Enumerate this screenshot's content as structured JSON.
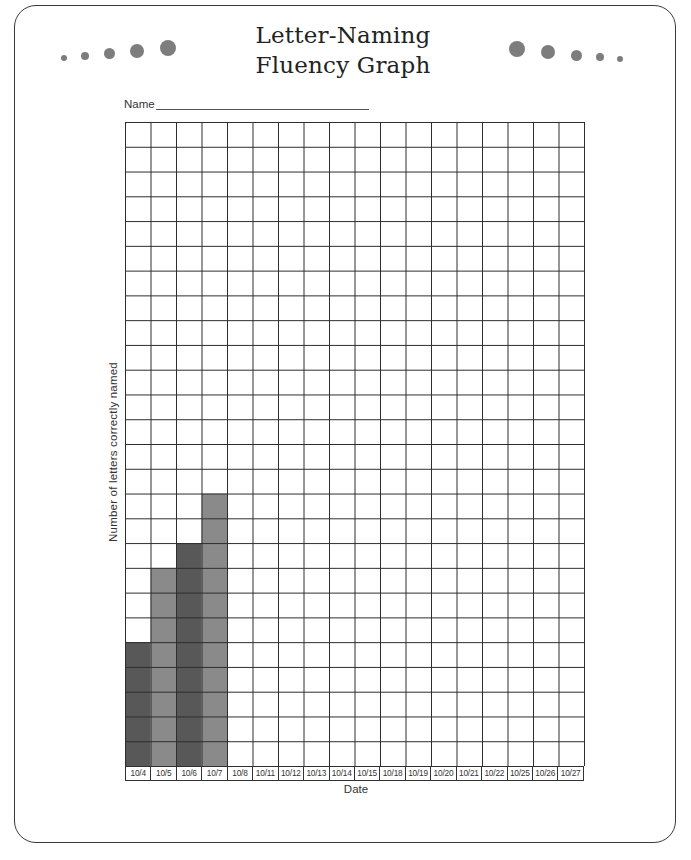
{
  "page": {
    "title_line1": "Letter-Naming",
    "title_line2": "Fluency Graph",
    "name_label": "Name"
  },
  "decorations": {
    "left_dots": [
      {
        "cx": 64,
        "cy": 58,
        "r": 3
      },
      {
        "cx": 85,
        "cy": 56,
        "r": 4
      },
      {
        "cx": 109,
        "cy": 53,
        "r": 5.5
      },
      {
        "cx": 137,
        "cy": 51,
        "r": 7
      },
      {
        "cx": 168,
        "cy": 48,
        "r": 8
      }
    ],
    "right_dots": [
      {
        "cx": 517,
        "cy": 49,
        "r": 8
      },
      {
        "cx": 548,
        "cy": 52,
        "r": 7
      },
      {
        "cx": 576,
        "cy": 55,
        "r": 5.5
      },
      {
        "cx": 600,
        "cy": 57,
        "r": 4
      },
      {
        "cx": 620,
        "cy": 59,
        "r": 3
      },
      {
        "color": "#7d7d7d"
      }
    ]
  },
  "colors": {
    "bar_dark": "#585858",
    "bar_light": "#8a8a8a",
    "grid_line": "#2e2e2e",
    "dot": "#7d7d7d"
  },
  "chart_data": {
    "type": "bar",
    "title": "Letter-Naming Fluency Graph",
    "xlabel": "Date",
    "ylabel": "Number of letters correctly named",
    "categories": [
      "10/4",
      "10/5",
      "10/6",
      "10/7",
      "10/8",
      "10/11",
      "10/12",
      "10/13",
      "10/14",
      "10/15",
      "10/18",
      "10/19",
      "10/20",
      "10/21",
      "10/22",
      "10/25",
      "10/26",
      "10/27"
    ],
    "values": [
      5,
      8,
      9,
      11,
      null,
      null,
      null,
      null,
      null,
      null,
      null,
      null,
      null,
      null,
      null,
      null,
      null,
      null
    ],
    "bar_shades": [
      "dark",
      "light",
      "dark",
      "light"
    ],
    "ylim": [
      0,
      26
    ],
    "grid": true,
    "grid_rows": 26,
    "grid_cols": 18,
    "legend": null
  }
}
